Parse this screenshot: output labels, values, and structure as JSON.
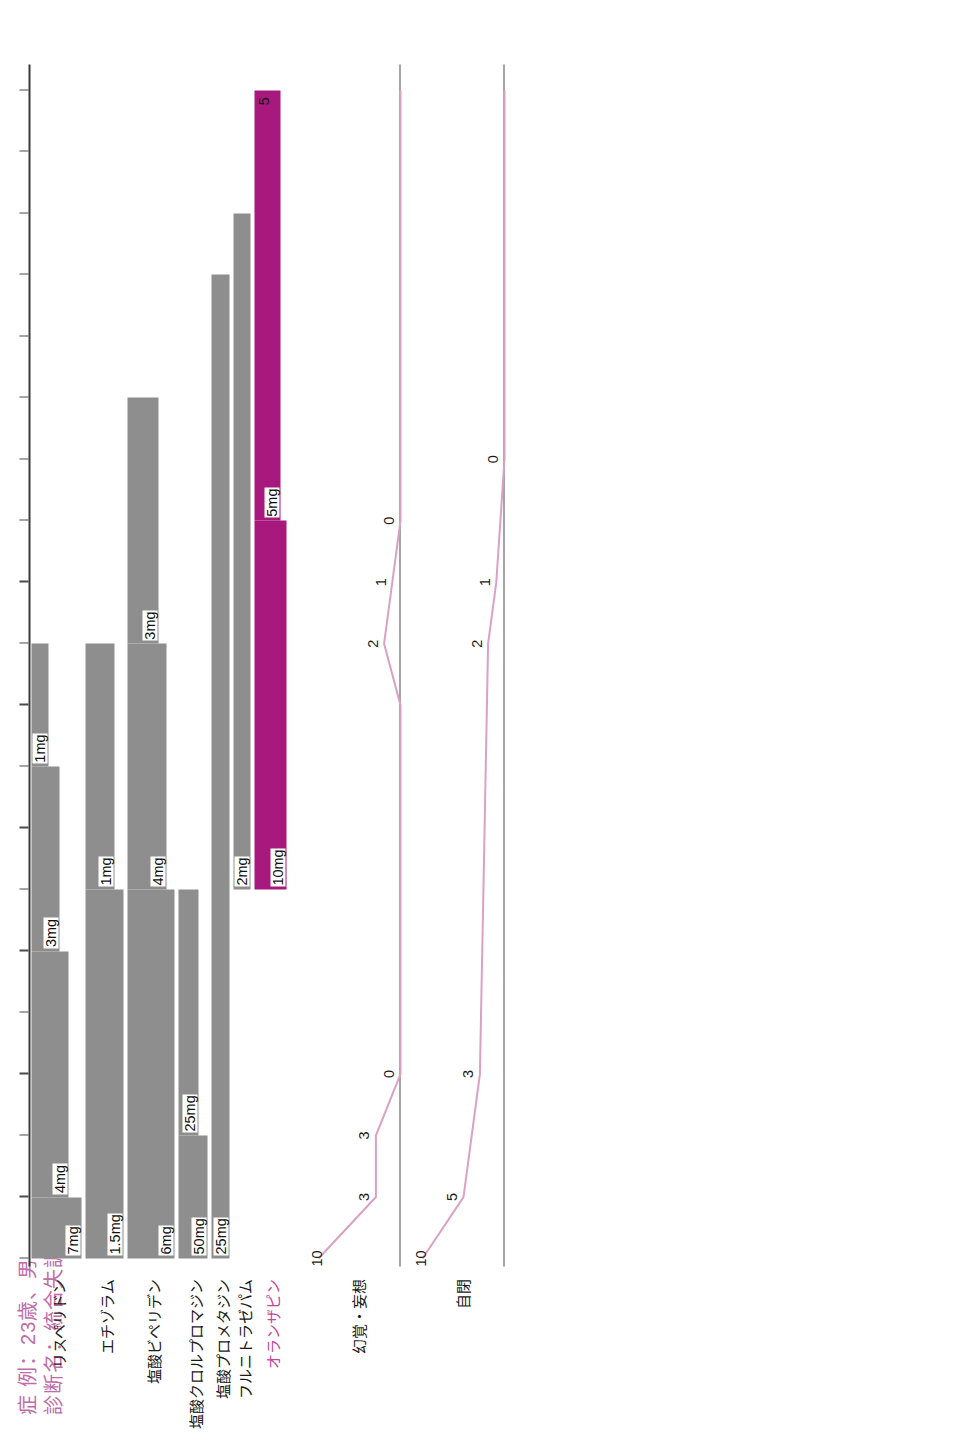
{
  "title": {
    "line1": "症 例：23歳、男",
    "line2": "診断名：統合失調症",
    "color": "#C06CA8"
  },
  "colors": {
    "bar_grey": "#8E8E8E",
    "bar_magenta": "#A8197E",
    "line_pink": "#D9A2C4",
    "axis": "#3A3A3A",
    "title_pink": "#C06CA8"
  },
  "chart_data": {
    "type": "bar",
    "xlabel": "",
    "ylabel": "",
    "grid": false,
    "legend": "none",
    "x_axis": {
      "ticks": [
        {
          "label": "3/19",
          "year": "X年",
          "pos": 0
        },
        {
          "label": "5/11",
          "year": "",
          "pos": 1
        },
        {
          "label": "5/29",
          "year": "",
          "pos": 2
        },
        {
          "label": "6/12",
          "year": "",
          "pos": 3
        },
        {
          "label": "7/3",
          "year": "",
          "pos": 4
        },
        {
          "label": "8/10",
          "year": "",
          "pos": 5
        },
        {
          "label": "9/14",
          "year": "",
          "pos": 6
        },
        {
          "label": "9/28",
          "year": "",
          "pos": 7
        },
        {
          "label": "10/12",
          "year": "",
          "pos": 8
        },
        {
          "label": "10/26",
          "year": "",
          "pos": 9
        },
        {
          "label": "11/13",
          "year": "",
          "pos": 10
        },
        {
          "label": "12/14",
          "year": "",
          "pos": 11
        },
        {
          "label": "1/11",
          "year": "X+1年",
          "pos": 12
        },
        {
          "label": "2/5",
          "year": "",
          "pos": 13
        },
        {
          "label": "3/5",
          "year": "",
          "pos": 14
        },
        {
          "label": "3/26",
          "year": "",
          "pos": 15
        },
        {
          "label": "4/23",
          "year": "",
          "pos": 16
        },
        {
          "label": "5/25",
          "year": "",
          "pos": 17
        },
        {
          "label": "8/15",
          "year": "",
          "pos": 18
        },
        {
          "label": "1/31",
          "year": "X+2年",
          "pos": 19
        }
      ]
    },
    "drug_rows": [
      {
        "name": "リスペリドン",
        "color": "grey",
        "segments": [
          {
            "dose": "7mg",
            "start": 0,
            "end": 1,
            "height": 50
          },
          {
            "dose": "4mg",
            "start": 1,
            "end": 5,
            "height": 37
          },
          {
            "dose": "3mg",
            "start": 5,
            "end": 8,
            "height": 28
          },
          {
            "dose": "1mg",
            "start": 8,
            "end": 10,
            "height": 17
          }
        ]
      },
      {
        "name": "エチゾラム",
        "color": "grey",
        "segments": [
          {
            "dose": "1.5mg",
            "start": 0,
            "end": 6,
            "height": 38
          },
          {
            "dose": "1mg",
            "start": 6,
            "end": 10,
            "height": 29
          }
        ]
      },
      {
        "name": "塩酸ビペリデン",
        "color": "grey",
        "segments": [
          {
            "dose": "6mg",
            "start": 0,
            "end": 6,
            "height": 47
          },
          {
            "dose": "4mg",
            "start": 6,
            "end": 10,
            "height": 39
          },
          {
            "dose": "3mg",
            "start": 10,
            "end": 14,
            "height": 31
          }
        ]
      },
      {
        "name": "塩酸クロルプロマジン",
        "color": "grey",
        "segments": [
          {
            "dose": "50mg",
            "start": 0,
            "end": 2,
            "height": 29
          },
          {
            "dose": "25mg",
            "start": 2,
            "end": 6,
            "height": 20
          }
        ]
      },
      {
        "name": "塩酸プロメタジン",
        "color": "grey",
        "segments": [
          {
            "dose": "25mg",
            "start": 0,
            "end": 16,
            "height": 18
          }
        ]
      },
      {
        "name": "フルニトラゼパム",
        "color": "grey",
        "segments": [
          {
            "dose": "2mg",
            "start": 6,
            "end": 17,
            "height": 17
          }
        ]
      },
      {
        "name": "オランザピン",
        "color": "magenta",
        "segments": [
          {
            "dose": "10mg",
            "start": 6,
            "end": 12,
            "height": 32
          },
          {
            "dose": "5mg",
            "start": 12,
            "end": 19,
            "height": 26,
            "end_marker": "5"
          }
        ]
      }
    ],
    "symptom_rows": [
      {
        "name": "幻覚・妄想",
        "ylim": [
          0,
          10
        ],
        "points": [
          {
            "pos": 0,
            "value": 10,
            "label": "10"
          },
          {
            "pos": 1,
            "value": 3,
            "label": "3"
          },
          {
            "pos": 2,
            "value": 3,
            "label": "3"
          },
          {
            "pos": 3,
            "value": 0,
            "label": "0"
          },
          {
            "pos": 9,
            "value": 0,
            "label": ""
          },
          {
            "pos": 10,
            "value": 2,
            "label": "2"
          },
          {
            "pos": 11,
            "value": 1,
            "label": "1"
          },
          {
            "pos": 12,
            "value": 0,
            "label": "0"
          },
          {
            "pos": 19,
            "value": 0,
            "label": ""
          }
        ]
      },
      {
        "name": "自閉",
        "ylim": [
          0,
          10
        ],
        "points": [
          {
            "pos": 0,
            "value": 10,
            "label": "10"
          },
          {
            "pos": 1,
            "value": 5,
            "label": "5"
          },
          {
            "pos": 3,
            "value": 3,
            "label": "3"
          },
          {
            "pos": 10,
            "value": 2,
            "label": "2"
          },
          {
            "pos": 11,
            "value": 1,
            "label": "1"
          },
          {
            "pos": 13,
            "value": 0,
            "label": "0"
          },
          {
            "pos": 19,
            "value": 0,
            "label": ""
          }
        ]
      }
    ]
  }
}
